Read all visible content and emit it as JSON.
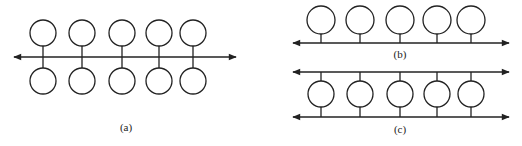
{
  "labels": {
    "a": "(a)",
    "b": "(b)",
    "c": "(c)"
  },
  "colors": {
    "stroke": "#222222",
    "background": "#ffffff"
  },
  "panels": {
    "a": {
      "description": "Central bidirectional bus with 5 nodes above and 5 nodes below",
      "nodes_top": 5,
      "nodes_bottom": 5
    },
    "b": {
      "description": "Single bidirectional bus with 5 nodes above",
      "nodes": 5
    },
    "c": {
      "description": "Dual bidirectional buses with 5 nodes connected to both",
      "nodes": 5
    }
  }
}
